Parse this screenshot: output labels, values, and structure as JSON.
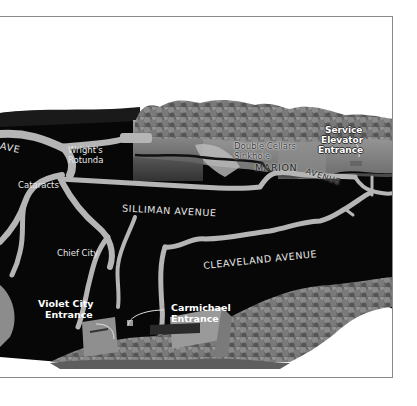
{
  "map": {
    "title": "Cave map illustration",
    "style": "grayscale 3D cross-section",
    "colors": {
      "cave_background": "#0a0a0a",
      "passage": "#b8b8b8",
      "forest": "#6e6e6e",
      "ground": "#9a9a9a",
      "label": "#e8e8e8",
      "frame": "#8a8a8a"
    }
  },
  "labels": {
    "ave_fragment": "AVE",
    "wrights_rotunda_line1": "Wright's",
    "wrights_rotunda_line2": "Rotunda",
    "cataracts": "Cataracts",
    "double_cellars_line1": "Double Cellars",
    "double_cellars_line2": "Sinkhole",
    "service_elevator_line1": "Service",
    "service_elevator_line2": "Elevator",
    "service_elevator_line3": "Entrance",
    "marion": "MARION",
    "avenue_marion": "AVENUE",
    "silliman_avenue": "SILLIMAN AVENUE",
    "cleaveland_avenue": "CLEAVELAND AVENUE",
    "chief_city": "Chief City",
    "violet_city_line1": "Violet City",
    "violet_city_line2": "Entrance",
    "carmichael_line1": "Carmichael",
    "carmichael_line2": "Entrance"
  }
}
